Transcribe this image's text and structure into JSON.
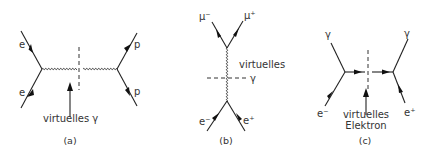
{
  "figure": {
    "panels": [
      {
        "id": "a",
        "caption": "(a)",
        "labels": {
          "in_top": "e",
          "in_bottom": "e",
          "out_top": "p",
          "out_bottom": "p",
          "annotation": "virtuelles γ"
        }
      },
      {
        "id": "b",
        "caption": "(b)",
        "labels": {
          "top_left": "μ⁻",
          "top_right": "μ⁺",
          "bottom_left": "e⁻",
          "bottom_right": "e⁺",
          "annotation_line1": "virtuelles",
          "annotation_line2": "γ"
        }
      },
      {
        "id": "c",
        "caption": "(c)",
        "labels": {
          "left_photon": "γ",
          "left_electron": "e⁻",
          "right_photon": "γ",
          "right_positron": "e⁺",
          "annotation_line1": "virtuelles",
          "annotation_line2": "Elektron"
        }
      }
    ]
  }
}
